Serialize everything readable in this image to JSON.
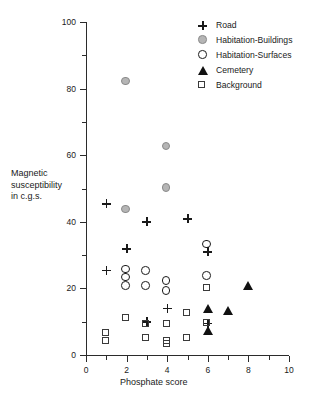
{
  "chart_data": {
    "type": "scatter",
    "title": "",
    "xlabel": "Phosphate score",
    "ylabel": "Magnetic susceptibility in c.g.s.",
    "ylabel_lines": [
      "Magnetic",
      "susceptibility",
      "in c.g.s."
    ],
    "xlim": [
      0,
      10
    ],
    "ylim": [
      0,
      100
    ],
    "xticks": [
      0,
      2,
      4,
      6,
      8,
      10
    ],
    "xticks_minor": [
      1,
      3,
      5,
      7,
      9
    ],
    "yticks": [
      0,
      20,
      40,
      60,
      80,
      100
    ],
    "yticks_minor": [
      10,
      30,
      50,
      70,
      90
    ],
    "grid": false,
    "legend_position": "top-right",
    "series": [
      {
        "name": "Road",
        "marker": "plus",
        "color": "#1a1a1a",
        "points": [
          {
            "x": 1,
            "y": 45.5
          },
          {
            "x": 1,
            "y": 25.5
          },
          {
            "x": 2,
            "y": 32
          },
          {
            "x": 3,
            "y": 40
          },
          {
            "x": 3,
            "y": 10
          },
          {
            "x": 4,
            "y": 14
          },
          {
            "x": 5,
            "y": 41
          },
          {
            "x": 6,
            "y": 31
          },
          {
            "x": 6,
            "y": 9.5
          }
        ]
      },
      {
        "name": "Habitation-Buildings",
        "marker": "filled-circle-gray",
        "color": "#b5b5b5",
        "points": [
          {
            "x": 2,
            "y": 82
          },
          {
            "x": 2,
            "y": 43.5
          },
          {
            "x": 4,
            "y": 62.5
          },
          {
            "x": 4,
            "y": 50
          }
        ]
      },
      {
        "name": "Habitation-Surfaces",
        "marker": "open-circle",
        "color": "#1a1a1a",
        "points": [
          {
            "x": 2,
            "y": 25.5
          },
          {
            "x": 2,
            "y": 23
          },
          {
            "x": 2,
            "y": 20.5
          },
          {
            "x": 3,
            "y": 25
          },
          {
            "x": 3,
            "y": 20.5
          },
          {
            "x": 4,
            "y": 22
          },
          {
            "x": 4,
            "y": 19
          },
          {
            "x": 6,
            "y": 33
          },
          {
            "x": 6,
            "y": 23.5
          }
        ]
      },
      {
        "name": "Cemetery",
        "marker": "filled-triangle",
        "color": "#111111",
        "points": [
          {
            "x": 6,
            "y": 14
          },
          {
            "x": 6,
            "y": 7.5
          },
          {
            "x": 7,
            "y": 13.5
          },
          {
            "x": 8,
            "y": 21
          }
        ]
      },
      {
        "name": "Background",
        "marker": "open-square",
        "color": "#3a3a3a",
        "points": [
          {
            "x": 1,
            "y": 6.5
          },
          {
            "x": 1,
            "y": 4
          },
          {
            "x": 2,
            "y": 11
          },
          {
            "x": 3,
            "y": 9
          },
          {
            "x": 3,
            "y": 5
          },
          {
            "x": 4,
            "y": 9
          },
          {
            "x": 4,
            "y": 4
          },
          {
            "x": 4,
            "y": 3
          },
          {
            "x": 5,
            "y": 12.5
          },
          {
            "x": 5,
            "y": 5
          },
          {
            "x": 6,
            "y": 20
          },
          {
            "x": 6,
            "y": 9.5
          }
        ]
      }
    ]
  },
  "legend": {
    "items": [
      {
        "label": "Road",
        "marker": "plus"
      },
      {
        "label": "Habitation-Buildings",
        "marker": "filled-circle-gray"
      },
      {
        "label": "Habitation-Surfaces",
        "marker": "open-circle"
      },
      {
        "label": "Cemetery",
        "marker": "filled-triangle"
      },
      {
        "label": "Background",
        "marker": "open-square"
      }
    ]
  }
}
